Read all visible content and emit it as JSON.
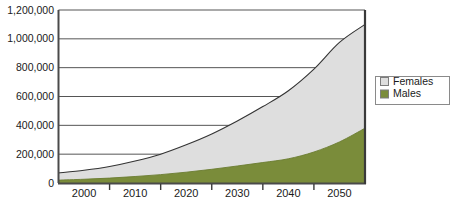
{
  "chart_data": {
    "type": "area",
    "stacked": true,
    "title": "",
    "subtitle": "",
    "xlabel": "",
    "ylabel": "",
    "xlim": [
      1995,
      2055
    ],
    "ylim": [
      0,
      1200000
    ],
    "grid": true,
    "legend_position": "right",
    "x": [
      1995,
      2000,
      2005,
      2010,
      2015,
      2020,
      2025,
      2030,
      2035,
      2040,
      2045,
      2050,
      2055
    ],
    "xtick_labels": [
      "2000",
      "2010",
      "2020",
      "2030",
      "2040",
      "2050"
    ],
    "xtick_values": [
      2000,
      2010,
      2020,
      2030,
      2040,
      2050
    ],
    "ytick_labels": [
      "0",
      "200,000",
      "400,000",
      "600,000",
      "800,000",
      "1,000,000",
      "1,200,000"
    ],
    "ytick_values": [
      0,
      200000,
      400000,
      600000,
      800000,
      1000000,
      1200000
    ],
    "series": [
      {
        "name": "Males",
        "color": "#7a8c3a",
        "values": [
          20000,
          26000,
          34000,
          45000,
          58000,
          75000,
          95000,
          118000,
          142000,
          168000,
          215000,
          285000,
          380000
        ]
      },
      {
        "name": "Females",
        "color": "#dedede",
        "values": [
          50000,
          62000,
          80000,
          107000,
          142000,
          190000,
          245000,
          312000,
          388000,
          472000,
          575000,
          690000,
          720000
        ]
      }
    ],
    "totals": [
      70000,
      88000,
      114000,
      152000,
      200000,
      265000,
      340000,
      430000,
      530000,
      640000,
      790000,
      975000,
      1100000
    ],
    "annotations": []
  },
  "legend": {
    "entries": [
      {
        "label": "Females",
        "swatch_color": "#dedede"
      },
      {
        "label": "Males",
        "swatch_color": "#7a8c3a"
      }
    ]
  }
}
